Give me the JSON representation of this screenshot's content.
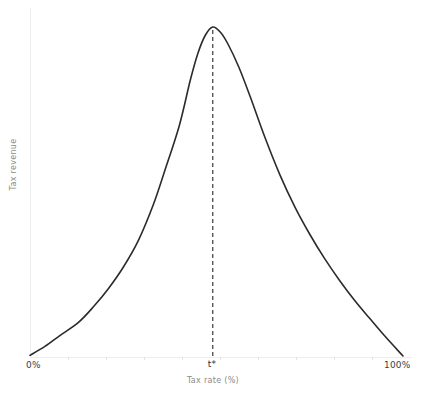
{
  "chart_data": {
    "type": "line",
    "title": "",
    "xlabel": "Tax rate (%)",
    "ylabel": "Tax revenue",
    "xlim": [
      0,
      100
    ],
    "ylim": [
      0,
      1
    ],
    "grid": false,
    "legend": "none",
    "x_tick_labels": [
      "0%",
      "t*",
      "100%"
    ],
    "x_tick_values": [
      0,
      49,
      100
    ],
    "y_tick_labels": [],
    "annotations": [
      {
        "name": "peak-marker",
        "label": "t*",
        "x": 49,
        "y": 1,
        "style": "vertical-dashed-line"
      }
    ],
    "series": [
      {
        "name": "Laffer curve",
        "color": "#2b2b2b",
        "x": [
          0,
          4,
          8,
          13,
          17,
          21,
          25,
          29,
          33,
          36,
          40,
          43,
          45,
          47,
          49,
          51,
          53,
          56,
          59,
          63,
          67,
          71,
          75,
          79,
          83,
          87,
          91,
          95,
          100
        ],
        "y": [
          0.005,
          0.032,
          0.065,
          0.105,
          0.152,
          0.207,
          0.272,
          0.352,
          0.46,
          0.56,
          0.7,
          0.84,
          0.92,
          0.975,
          1.0,
          0.985,
          0.95,
          0.878,
          0.79,
          0.665,
          0.552,
          0.455,
          0.372,
          0.298,
          0.232,
          0.172,
          0.118,
          0.065,
          0.003
        ]
      }
    ]
  },
  "axis_labels": {
    "x_zero": "0%",
    "x_max": "100%",
    "x_peak": "t*",
    "x_title": "Tax rate (%)",
    "y_title": "Tax revenue"
  },
  "colors": {
    "curve": "#2b2b2b",
    "axis": "#ededed",
    "tick": "#e4e4e4",
    "dash": "#3a3a3a",
    "tick_label": "#3d3d3d",
    "axis_title": "#8a8a8a",
    "background": "#ffffff"
  }
}
